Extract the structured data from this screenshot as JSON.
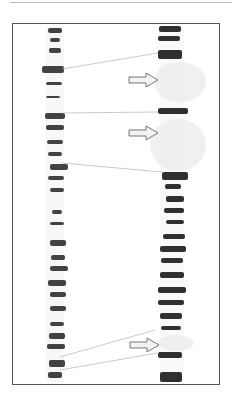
{
  "figure": {
    "colors": {
      "band": "#1a1a1a",
      "connector": "#bdbdbd",
      "arrow_fill": "#f2f2f2",
      "arrow_stroke": "#777777",
      "frame": "#555555"
    },
    "arrows": [
      {
        "x": 129,
        "y": 80
      },
      {
        "x": 129,
        "y": 133
      },
      {
        "x": 130,
        "y": 345
      }
    ],
    "connectors": [
      {
        "x1": 62,
        "y1": 69,
        "x2": 158,
        "y2": 53
      },
      {
        "x1": 62,
        "y1": 113,
        "x2": 158,
        "y2": 112
      },
      {
        "x1": 62,
        "y1": 163,
        "x2": 162,
        "y2": 172
      },
      {
        "x1": 60,
        "y1": 357,
        "x2": 155,
        "y2": 330
      },
      {
        "x1": 60,
        "y1": 370,
        "x2": 157,
        "y2": 353
      }
    ],
    "left_bands": [
      [
        48,
        28,
        14,
        5
      ],
      [
        50,
        38,
        10,
        4
      ],
      [
        49,
        48,
        12,
        5
      ],
      [
        42,
        66,
        22,
        7
      ],
      [
        46,
        82,
        16,
        3
      ],
      [
        46,
        96,
        14,
        2
      ],
      [
        45,
        113,
        20,
        6
      ],
      [
        46,
        125,
        18,
        5
      ],
      [
        47,
        140,
        16,
        4
      ],
      [
        48,
        152,
        14,
        4
      ],
      [
        50,
        164,
        18,
        6
      ],
      [
        48,
        176,
        16,
        4
      ],
      [
        50,
        188,
        14,
        4
      ],
      [
        52,
        210,
        10,
        4
      ],
      [
        50,
        222,
        14,
        3
      ],
      [
        50,
        240,
        16,
        6
      ],
      [
        51,
        255,
        14,
        5
      ],
      [
        50,
        266,
        18,
        5
      ],
      [
        48,
        280,
        18,
        6
      ],
      [
        50,
        292,
        16,
        5
      ],
      [
        50,
        306,
        16,
        5
      ],
      [
        50,
        322,
        14,
        4
      ],
      [
        49,
        333,
        16,
        6
      ],
      [
        47,
        344,
        18,
        5
      ],
      [
        49,
        360,
        16,
        7
      ],
      [
        48,
        372,
        14,
        6
      ]
    ],
    "right_bands": [
      [
        159,
        26,
        22,
        6
      ],
      [
        158,
        36,
        22,
        5
      ],
      [
        158,
        50,
        24,
        9
      ],
      [
        158,
        108,
        30,
        6
      ],
      [
        162,
        172,
        26,
        8
      ],
      [
        165,
        184,
        16,
        5
      ],
      [
        166,
        196,
        18,
        6
      ],
      [
        164,
        208,
        20,
        5
      ],
      [
        166,
        220,
        18,
        4
      ],
      [
        163,
        234,
        22,
        5
      ],
      [
        160,
        246,
        26,
        6
      ],
      [
        161,
        258,
        22,
        5
      ],
      [
        160,
        272,
        24,
        6
      ],
      [
        158,
        287,
        28,
        6
      ],
      [
        158,
        300,
        26,
        5
      ],
      [
        160,
        313,
        22,
        6
      ],
      [
        161,
        326,
        20,
        4
      ],
      [
        158,
        352,
        24,
        6
      ],
      [
        160,
        372,
        22,
        10
      ]
    ],
    "faint_regions": [
      {
        "cx": 180,
        "cy": 82,
        "rx": 26,
        "ry": 20
      },
      {
        "cx": 178,
        "cy": 145,
        "rx": 28,
        "ry": 26
      },
      {
        "cx": 176,
        "cy": 343,
        "rx": 18,
        "ry": 8
      }
    ]
  }
}
